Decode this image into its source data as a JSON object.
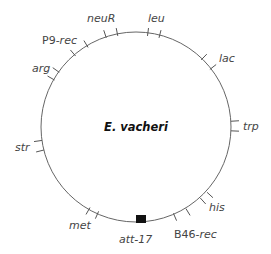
{
  "diagram": {
    "title": "E. vacheri",
    "type": "circular genetic map",
    "circle": {
      "cx": 136,
      "cy": 127,
      "r": 95,
      "stroke": "#666666"
    },
    "markers": [
      {
        "name": "neuR",
        "label": "neuR",
        "italic": true,
        "ticks": [
          [
            105,
            34
          ],
          [
            117,
            32
          ]
        ],
        "label_pos": [
          87,
          22
        ]
      },
      {
        "name": "leu",
        "label": "leu",
        "italic": true,
        "ticks": [
          [
            148,
            32
          ],
          [
            160,
            34
          ]
        ],
        "label_pos": [
          148,
          22
        ]
      },
      {
        "name": "lac",
        "label": "lac",
        "italic": true,
        "ticks": [
          [
            204,
            57
          ],
          [
            213,
            67
          ]
        ],
        "label_pos": [
          219,
          62
        ]
      },
      {
        "name": "trp",
        "label": "trp",
        "italic": true,
        "ticks": [
          [
            235,
            121
          ],
          [
            235,
            131
          ]
        ],
        "label_pos": [
          243,
          130
        ]
      },
      {
        "name": "his",
        "label": "his",
        "italic": true,
        "ticks": [
          [
            203,
            201
          ],
          [
            210,
            195
          ]
        ],
        "label_pos": [
          209,
          211
        ]
      },
      {
        "name": "B46-rec",
        "label_plain": "B46-",
        "label_italic": "rec",
        "ticks": [
          [
            175,
            217
          ],
          [
            188,
            212
          ]
        ],
        "label_pos": [
          174,
          238
        ]
      },
      {
        "name": "met",
        "label": "met",
        "italic": true,
        "ticks": [
          [
            88,
            211
          ],
          [
            97,
            215
          ]
        ],
        "label_pos": [
          69,
          229
        ]
      },
      {
        "name": "str",
        "label": "str",
        "italic": true,
        "ticks": [
          [
            38,
            141
          ],
          [
            40,
            151
          ]
        ],
        "label_pos": [
          15,
          151
        ]
      },
      {
        "name": "arg",
        "label": "arg",
        "italic": true,
        "ticks": [
          [
            56,
            70
          ],
          [
            51,
            78
          ]
        ],
        "label_pos": [
          32,
          72
        ]
      },
      {
        "name": "P9-rec",
        "label_plain": "P9-",
        "label_italic": "rec",
        "ticks": [
          [
            73,
            53
          ],
          [
            86,
            44
          ]
        ],
        "label_pos": [
          42,
          44
        ]
      }
    ],
    "att_site": {
      "label": "att-17",
      "box": [
        136,
        215,
        10,
        8
      ],
      "label_pos": [
        119,
        243
      ],
      "fill": "#111111"
    }
  }
}
